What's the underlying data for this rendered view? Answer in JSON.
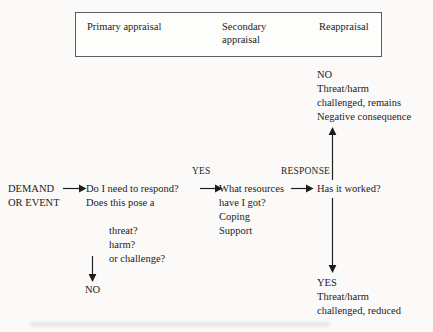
{
  "diagram": {
    "background_color": "#fbfaf8",
    "ink_color": "#1c1c1c",
    "stage_box": {
      "border_color": "#5d5d5d",
      "columns": [
        {
          "name": "primary",
          "label": "Primary appraisal"
        },
        {
          "name": "secondary",
          "label": "Secondary\nappraisal"
        },
        {
          "name": "reappraisal",
          "label": "Reappraisal"
        }
      ]
    },
    "nodes": {
      "demand": "DEMAND\nOR EVENT",
      "primary_question_head": "Do I need to respond?\nDoes this pose a",
      "primary_question_tail": "threat?\nharm?\nor challenge?",
      "resources": "What resources\nhave I got?\nCoping\nSupport",
      "worked_question": "Has it worked?",
      "branch_no": "NO",
      "outcome_no": "NO\nThreat/harm\nchallenged, remains\nNegative consequence",
      "outcome_yes": "YES\nThreat/harm\nchallenged, reduced"
    },
    "edge_labels": {
      "yes": "YES",
      "response": "RESPONSE"
    },
    "arrows": [
      {
        "name": "demand-to-primary",
        "direction": "right"
      },
      {
        "name": "primary-to-resources",
        "direction": "right"
      },
      {
        "name": "resources-to-worked",
        "direction": "right"
      },
      {
        "name": "primary-to-no",
        "direction": "down"
      },
      {
        "name": "worked-to-outcome-no",
        "direction": "up"
      },
      {
        "name": "worked-to-outcome-yes",
        "direction": "down"
      }
    ]
  }
}
